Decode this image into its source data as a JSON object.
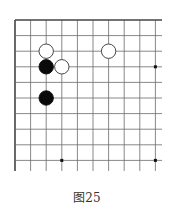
{
  "diagram": {
    "type": "go-board-corner",
    "columns": 10,
    "rows": 10,
    "caption": "图25",
    "colors": {
      "line": "#6a6a6a",
      "edge": "#444444",
      "black_stone": "#0a0a0a",
      "white_stone": "#ffffff",
      "white_outline": "#333333",
      "star": "#111111"
    },
    "stones": [
      {
        "color": "white",
        "col": 2,
        "row": 2
      },
      {
        "color": "white",
        "col": 6,
        "row": 2
      },
      {
        "color": "black",
        "col": 2,
        "row": 3
      },
      {
        "color": "white",
        "col": 3,
        "row": 3
      },
      {
        "color": "black",
        "col": 2,
        "row": 5
      }
    ],
    "star_points": [
      {
        "col": 9,
        "row": 3
      },
      {
        "col": 3,
        "row": 9
      },
      {
        "col": 9,
        "row": 9
      }
    ]
  }
}
